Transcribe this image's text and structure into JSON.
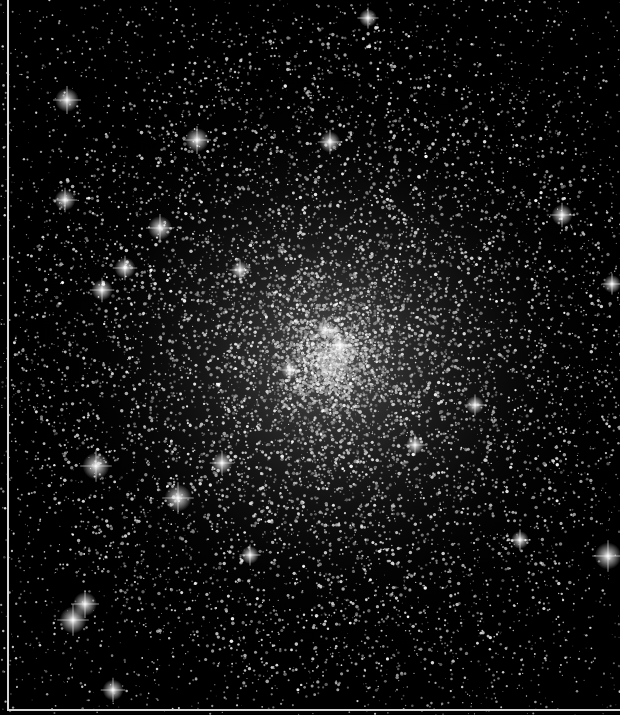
{
  "image": {
    "subject": "globular star cluster",
    "description": "Dense globular star cluster on black background, bright core near center with many diffraction-spiked foreground stars",
    "width": 620,
    "height": 715,
    "background_color": "#000000",
    "border_color": "#d8d8d8",
    "cluster_center": [
      330,
      360
    ],
    "core_radius": 140,
    "halo_radius": 320,
    "star_color": "#ffffff",
    "core_glow_color": "#9a9a9a"
  },
  "bright_stars": [
    [
      67,
      100,
      4
    ],
    [
      197,
      140,
      4
    ],
    [
      330,
      142,
      3.5
    ],
    [
      160,
      228,
      4
    ],
    [
      65,
      200,
      3.5
    ],
    [
      125,
      268,
      3.5
    ],
    [
      102,
      290,
      3.5
    ],
    [
      562,
      215,
      3.5
    ],
    [
      96,
      466,
      4.5
    ],
    [
      178,
      498,
      4.5
    ],
    [
      222,
      463,
      3.5
    ],
    [
      608,
      556,
      4.5
    ],
    [
      85,
      604,
      4
    ],
    [
      73,
      620,
      4.5
    ],
    [
      113,
      690,
      3.5
    ],
    [
      340,
      345,
      3.5
    ],
    [
      325,
      330,
      3
    ],
    [
      290,
      370,
      3
    ],
    [
      415,
      445,
      3
    ],
    [
      368,
      18,
      3
    ],
    [
      475,
      405,
      3
    ],
    [
      250,
      555,
      3
    ],
    [
      520,
      540,
      3
    ],
    [
      612,
      284,
      3
    ],
    [
      240,
      270,
      3
    ]
  ]
}
